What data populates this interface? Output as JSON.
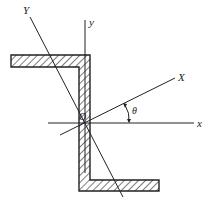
{
  "diagram": {
    "type": "Z-section cross-section with principal axes",
    "labels": {
      "Y_axis": "Y",
      "y_axis": "y",
      "X_axis": "X",
      "x_axis": "x",
      "origin": "O",
      "angle": "θ"
    },
    "colors": {
      "stroke": "#222222",
      "background": "#ffffff"
    },
    "geometry": {
      "origin": [
        84,
        123
      ],
      "top_flange": {
        "x": 11,
        "y": 55,
        "w": 79,
        "h": 12
      },
      "web": {
        "x": 79,
        "y": 55,
        "w": 11,
        "h": 136
      },
      "bottom_flange": {
        "x": 79,
        "y": 180,
        "w": 80,
        "h": 11
      },
      "x_axis": {
        "from": [
          48,
          123
        ],
        "to": [
          194,
          123
        ]
      },
      "y_axis": {
        "from": [
          85,
          20
        ],
        "to": [
          85,
          173
        ]
      },
      "X_axis": {
        "from": [
          60,
          135
        ],
        "to": [
          175,
          78
        ]
      },
      "Y_axis": {
        "from": [
          30,
          17
        ],
        "to": [
          123,
          197
        ]
      }
    }
  }
}
